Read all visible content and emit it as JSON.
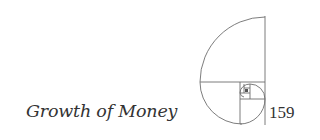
{
  "title": "Growth of Money",
  "page_number": "159",
  "figure": {
    "name": "golden-spiral",
    "stroke_color": "#6e6e6e"
  }
}
